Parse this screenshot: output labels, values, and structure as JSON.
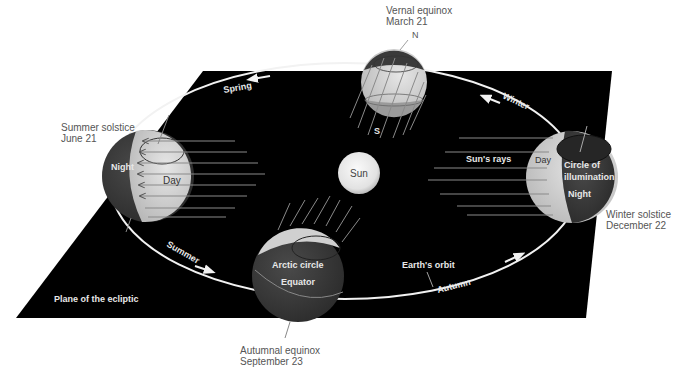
{
  "diagram": {
    "type": "Earth's orbit around the Sun with seasons",
    "plane_label": "Plane of the ecliptic",
    "sun_label": "Sun",
    "orbit_label": "Earth's orbit",
    "rays_label": "Sun's rays",
    "seasons": {
      "spring": "Spring",
      "summer": "Summer",
      "autumn": "Autumn",
      "winter": "Winter"
    },
    "positions": {
      "vernal": {
        "title": "Vernal equinox",
        "date": "March 21",
        "north": "N",
        "south": "S"
      },
      "summer": {
        "title": "Summer solstice",
        "date": "June 21",
        "night": "Night",
        "day": "Day"
      },
      "autumnal": {
        "title": "Autumnal equinox",
        "date": "September 23",
        "arctic": "Arctic circle",
        "equator": "Equator"
      },
      "winter": {
        "title": "Winter solstice",
        "date": "December 22",
        "day": "Day",
        "night": "Night",
        "circle1": "Circle of",
        "circle2": "illumination"
      }
    },
    "colors": {
      "plane": "#000000",
      "globe_day": "#d4d4d4",
      "globe_night": "#3a3a3a",
      "sun": "#e6e6e6",
      "caption": "#555555",
      "ray": "#8a8a8a",
      "orbit": "#f2f2f2"
    }
  }
}
